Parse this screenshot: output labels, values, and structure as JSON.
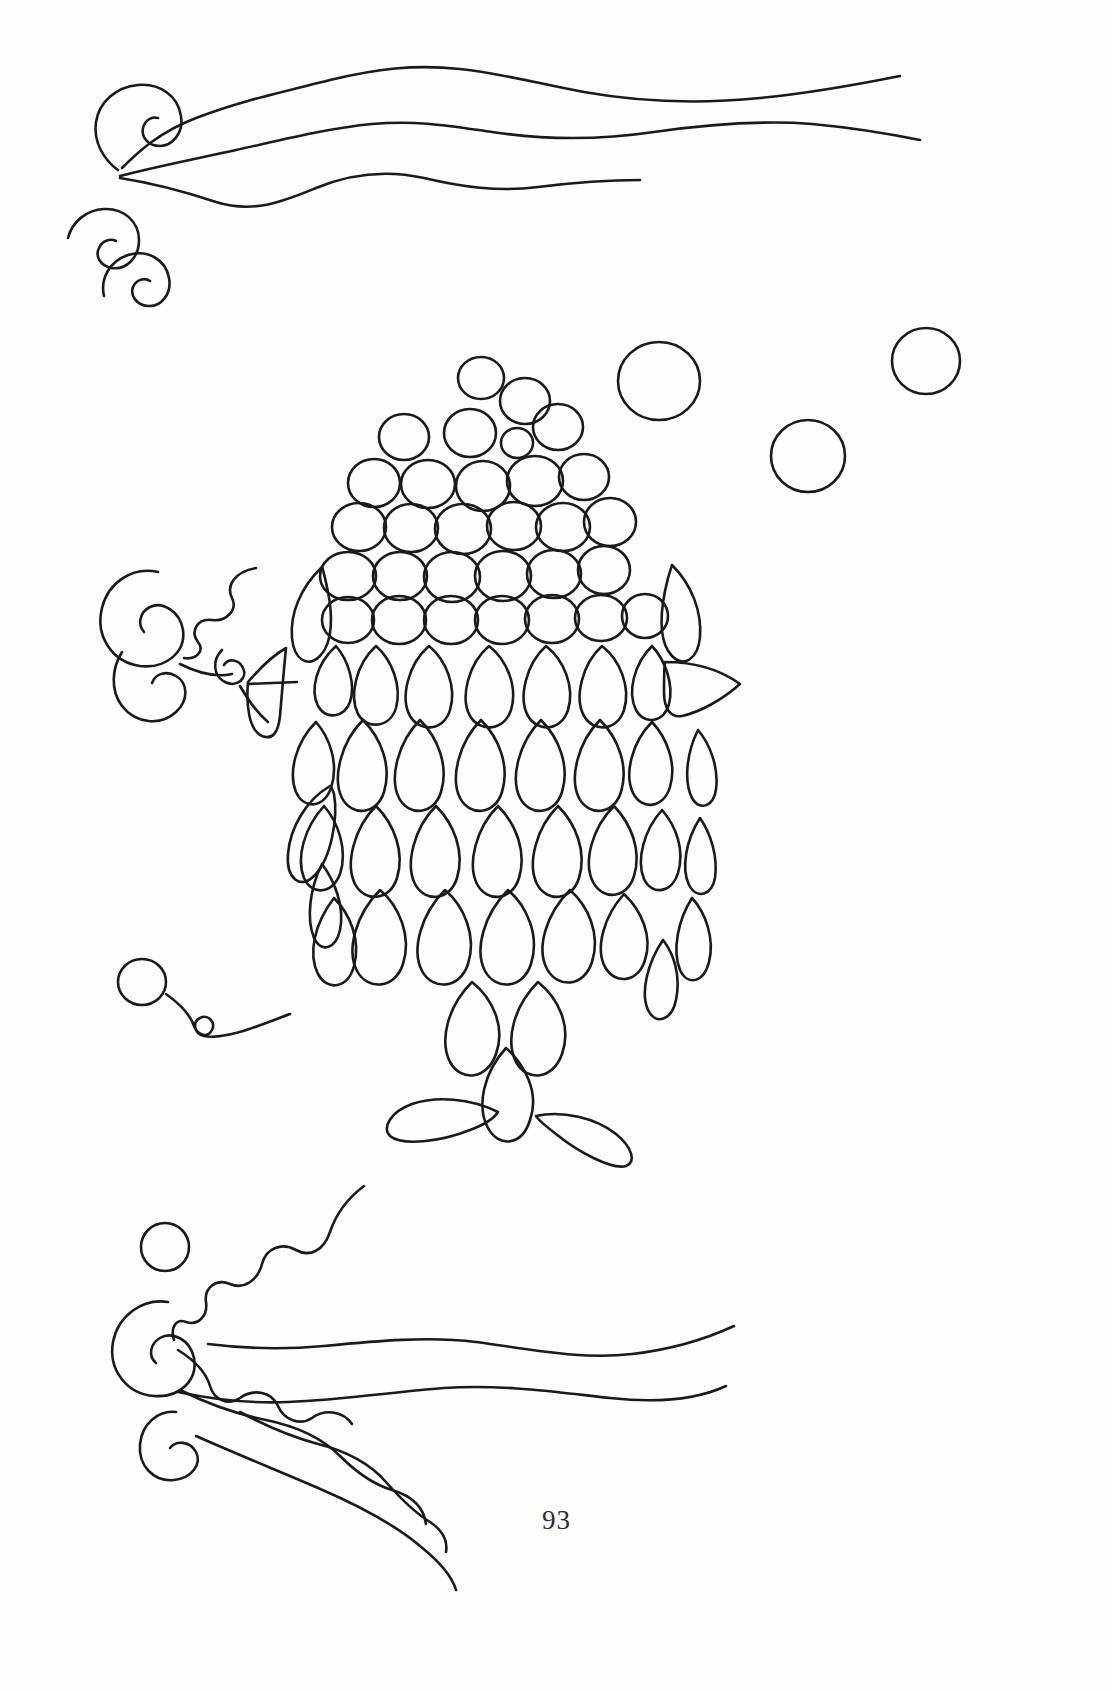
{
  "page": {
    "number": "93",
    "background_color": "#ffffff",
    "ink_color": "#1a1a1a",
    "width": 1113,
    "height": 1690
  },
  "artwork": {
    "subject": "decorative fish",
    "style": "line art outline / quilling template",
    "stroke_width": 2.6,
    "elements": {
      "fish_head_circles_label": "fish scale circles",
      "fish_body_petals_label": "fish scale teardrops",
      "fish_fins_label": "fish fins",
      "fish_tail_label": "fish tail fins",
      "bubbles_label": "water bubbles",
      "waves_label": "water wave lines",
      "scrolls_label": "comma scroll shapes"
    },
    "circles": [
      {
        "cx": 481,
        "cy": 378,
        "r": 22
      },
      {
        "cx": 524,
        "cy": 401,
        "r": 24
      },
      {
        "cx": 404,
        "cy": 437,
        "r": 24
      },
      {
        "cx": 470,
        "cy": 433,
        "r": 25
      },
      {
        "cx": 517,
        "cy": 443,
        "r": 15
      },
      {
        "cx": 557,
        "cy": 427,
        "r": 24
      },
      {
        "cx": 374,
        "cy": 483,
        "r": 25
      },
      {
        "cx": 428,
        "cy": 484,
        "r": 26
      },
      {
        "cx": 483,
        "cy": 486,
        "r": 26
      },
      {
        "cx": 534,
        "cy": 481,
        "r": 27
      },
      {
        "cx": 583,
        "cy": 477,
        "r": 24
      },
      {
        "cx": 359,
        "cy": 527,
        "r": 26
      },
      {
        "cx": 410,
        "cy": 528,
        "r": 26
      },
      {
        "cx": 462,
        "cy": 529,
        "r": 27
      },
      {
        "cx": 513,
        "cy": 526,
        "r": 26
      },
      {
        "cx": 562,
        "cy": 527,
        "r": 26
      },
      {
        "cx": 609,
        "cy": 522,
        "r": 25
      },
      {
        "cx": 348,
        "cy": 576,
        "r": 27
      },
      {
        "cx": 400,
        "cy": 576,
        "r": 26
      },
      {
        "cx": 452,
        "cy": 577,
        "r": 27
      },
      {
        "cx": 503,
        "cy": 576,
        "r": 27
      },
      {
        "cx": 554,
        "cy": 574,
        "r": 26
      },
      {
        "cx": 603,
        "cy": 570,
        "r": 25
      },
      {
        "cx": 348,
        "cy": 620,
        "r": 25
      },
      {
        "cx": 399,
        "cy": 620,
        "r": 26
      },
      {
        "cx": 451,
        "cy": 620,
        "r": 26
      },
      {
        "cx": 502,
        "cy": 620,
        "r": 26
      },
      {
        "cx": 552,
        "cy": 619,
        "r": 26
      },
      {
        "cx": 601,
        "cy": 618,
        "r": 25
      },
      {
        "cx": 644,
        "cy": 615,
        "r": 22
      }
    ],
    "bubbles": [
      {
        "cx": 659,
        "cy": 381,
        "r": 40
      },
      {
        "cx": 926,
        "cy": 361,
        "r": 34
      },
      {
        "cx": 808,
        "cy": 456,
        "r": 37
      },
      {
        "cx": 142,
        "cy": 982,
        "r": 24
      },
      {
        "cx": 165,
        "cy": 1247,
        "r": 24
      }
    ],
    "petal_rows": [
      {
        "row": 1,
        "count": 7,
        "y": 680,
        "w": 52,
        "h": 86
      },
      {
        "row": 2,
        "count": 8,
        "y": 775,
        "w": 54,
        "h": 88
      },
      {
        "row": 3,
        "count": 8,
        "y": 862,
        "w": 54,
        "h": 88
      },
      {
        "row": 4,
        "count": 6,
        "y": 950,
        "w": 54,
        "h": 88
      },
      {
        "row": 5,
        "count": 2,
        "y": 1030,
        "w": 54,
        "h": 86
      },
      {
        "row": 6,
        "count": 1,
        "y": 1098,
        "w": 48,
        "h": 80
      }
    ],
    "fins": [
      {
        "name": "left-pectoral-fin",
        "x": 258,
        "y": 650
      },
      {
        "name": "right-pectoral-fin",
        "x": 665,
        "y": 650
      },
      {
        "name": "tail-fin-left",
        "x": 430,
        "y": 1120
      },
      {
        "name": "tail-fin-right",
        "x": 585,
        "y": 1130
      }
    ],
    "waves": [
      {
        "name": "wave-top-1",
        "y": 80
      },
      {
        "name": "wave-top-2",
        "y": 135
      },
      {
        "name": "wave-top-3",
        "y": 185
      },
      {
        "name": "wave-bottom-1",
        "y": 1250
      },
      {
        "name": "wave-bottom-2",
        "y": 1350
      },
      {
        "name": "wave-bottom-3",
        "y": 1440
      }
    ],
    "scrolls": [
      {
        "name": "scroll-top-left-1",
        "x": 118,
        "y": 120
      },
      {
        "name": "scroll-top-left-2",
        "x": 98,
        "y": 232
      },
      {
        "name": "scroll-top-left-3",
        "x": 133,
        "y": 272
      },
      {
        "name": "scroll-mid-left-1",
        "x": 133,
        "y": 598
      },
      {
        "name": "scroll-mid-left-2",
        "x": 140,
        "y": 678
      },
      {
        "name": "scroll-bottom-left-1",
        "x": 133,
        "y": 1330
      },
      {
        "name": "scroll-bottom-left-2",
        "x": 158,
        "y": 1440
      }
    ]
  }
}
